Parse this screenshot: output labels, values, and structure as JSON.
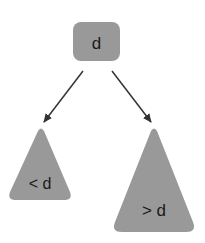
{
  "diagram": {
    "type": "binary-search-tree-partition",
    "root": {
      "label": "d"
    },
    "left_subtree": {
      "label": "< d"
    },
    "right_subtree": {
      "label": "> d"
    },
    "edges": [
      {
        "from": "root",
        "to": "left_subtree"
      },
      {
        "from": "root",
        "to": "right_subtree"
      }
    ],
    "colors": {
      "node_fill": "#999999",
      "text": "#1a1a1a",
      "arrow": "#333333",
      "background": "#ffffff"
    }
  }
}
